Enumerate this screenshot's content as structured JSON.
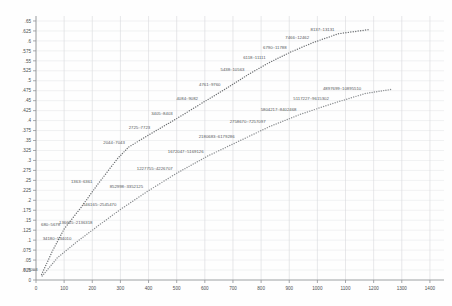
{
  "chart": {
    "type": "scatter",
    "title": "",
    "subtitle": "",
    "xlabel": "",
    "ylabel": "",
    "background_color": "#fefefe",
    "grid": true,
    "grid_color": "#e2e4e6",
    "axis_color": "#8f9295",
    "legend": "none",
    "xlim": [
      0,
      1450
    ],
    "ylim": [
      0,
      0.6625
    ],
    "x_ticks": [
      0,
      100,
      200,
      300,
      400,
      500,
      600,
      700,
      800,
      900,
      1000,
      1100,
      1200,
      1300,
      1400
    ],
    "x_tick_labels": [
      "0",
      "100",
      "200",
      "300",
      "400",
      "500",
      "600",
      "700",
      "800",
      "900",
      "1000",
      "1100",
      "1200",
      "1300",
      "1400"
    ],
    "y_ticks": [
      0,
      0.025,
      0.05,
      0.075,
      0.1,
      0.125,
      0.15,
      0.175,
      0.2,
      0.225,
      0.25,
      0.275,
      0.3,
      0.325,
      0.35,
      0.375,
      0.4,
      0.425,
      0.45,
      0.475,
      0.5,
      0.525,
      0.55,
      0.575,
      0.6,
      0.625,
      0.65
    ],
    "y_tick_labels": [
      "0",
      ".025",
      ".05",
      ".075",
      ".1",
      ".125",
      ".15",
      ".175",
      ".2",
      ".225",
      ".25",
      ".275",
      ".3",
      ".325",
      ".35",
      ".375",
      ".4",
      ".425",
      ".45",
      ".475",
      ".5",
      ".525",
      ".55",
      ".575",
      ".6",
      ".625",
      ".65"
    ],
    "series": [
      {
        "name": "upper-curve",
        "marker": "dot",
        "color": "#6e7174",
        "points": [
          {
            "x": 20,
            "y": 0.014,
            "label": "8::5003"
          },
          {
            "x": 60,
            "y": 0.075,
            "label": ""
          },
          {
            "x": 100,
            "y": 0.128,
            "label": "680::5678"
          },
          {
            "x": 160,
            "y": 0.182,
            "label": ""
          },
          {
            "x": 215,
            "y": 0.236,
            "label": "1363::6361"
          },
          {
            "x": 290,
            "y": 0.305,
            "label": ""
          },
          {
            "x": 330,
            "y": 0.334,
            "label": "2044::7043"
          },
          {
            "x": 420,
            "y": 0.372,
            "label": "2725::7723"
          },
          {
            "x": 500,
            "y": 0.405,
            "label": "3405::8403"
          },
          {
            "x": 590,
            "y": 0.444,
            "label": "4084::9082"
          },
          {
            "x": 670,
            "y": 0.478,
            "label": "4761::9760"
          },
          {
            "x": 755,
            "y": 0.516,
            "label": "5438::10563"
          },
          {
            "x": 830,
            "y": 0.546,
            "label": "6118::11111"
          },
          {
            "x": 905,
            "y": 0.572,
            "label": "6790::11788"
          },
          {
            "x": 985,
            "y": 0.596,
            "label": "7466::12462"
          },
          {
            "x": 1075,
            "y": 0.618,
            "label": "8137::13131"
          },
          {
            "x": 1180,
            "y": 0.628,
            "label": ""
          }
        ]
      },
      {
        "name": "lower-curve",
        "marker": "dot",
        "color": "#8a8d90",
        "points": [
          {
            "x": 22,
            "y": 0.01,
            "label": ""
          },
          {
            "x": 75,
            "y": 0.055,
            "label": ""
          },
          {
            "x": 140,
            "y": 0.093,
            "label": "34180::534010"
          },
          {
            "x": 215,
            "y": 0.133,
            "label": "136665::2136318"
          },
          {
            "x": 300,
            "y": 0.177,
            "label": "546165::2545470"
          },
          {
            "x": 395,
            "y": 0.222,
            "label": "852998::3352125"
          },
          {
            "x": 500,
            "y": 0.268,
            "label": "1227755::4226707"
          },
          {
            "x": 610,
            "y": 0.311,
            "label": "1672047::5169126"
          },
          {
            "x": 720,
            "y": 0.348,
            "label": "2180683::6179286"
          },
          {
            "x": 830,
            "y": 0.385,
            "label": "2758670::7257097"
          },
          {
            "x": 940,
            "y": 0.416,
            "label": "5804217::8402468"
          },
          {
            "x": 1055,
            "y": 0.443,
            "label": "5117227::9615302"
          },
          {
            "x": 1170,
            "y": 0.468,
            "label": "4897699::10895510"
          },
          {
            "x": 1260,
            "y": 0.478,
            "label": ""
          }
        ]
      }
    ]
  }
}
